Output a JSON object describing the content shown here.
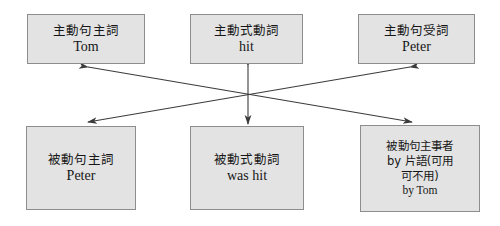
{
  "diagram": {
    "style": {
      "box_fill": "#e3e3e3",
      "box_border": "#8d8d8d",
      "arrow_color": "#3b3b3b",
      "background": "#ffffff",
      "text_color": "#161616"
    },
    "nodes": [
      {
        "id": "active-subject",
        "role": "active-sentence-subject",
        "lines": [
          "主動句主詞",
          "Tom"
        ]
      },
      {
        "id": "active-verb",
        "role": "active-voice-verb",
        "lines": [
          "主動式動詞",
          "hit"
        ]
      },
      {
        "id": "active-object",
        "role": "active-sentence-object",
        "lines": [
          "主動句受詞",
          "Peter"
        ]
      },
      {
        "id": "passive-subject",
        "role": "passive-sentence-subject",
        "lines": [
          "被動句主詞",
          "Peter"
        ]
      },
      {
        "id": "passive-verb",
        "role": "passive-voice-verb",
        "lines": [
          "被動式動詞",
          "was hit"
        ]
      },
      {
        "id": "passive-agent",
        "role": "passive-sentence-agent",
        "lines": [
          "被動句主事者",
          "by 片語(可用",
          "可不用)",
          "by Tom"
        ]
      }
    ],
    "connectors": [
      {
        "id": "subject-to-agent",
        "from": "active-subject",
        "to": "passive-agent",
        "heads": "both"
      },
      {
        "id": "object-to-subject",
        "from": "active-object",
        "to": "passive-subject",
        "heads": "both"
      },
      {
        "id": "verb-to-verb",
        "from": "active-verb",
        "to": "passive-verb",
        "heads": "both"
      }
    ]
  }
}
